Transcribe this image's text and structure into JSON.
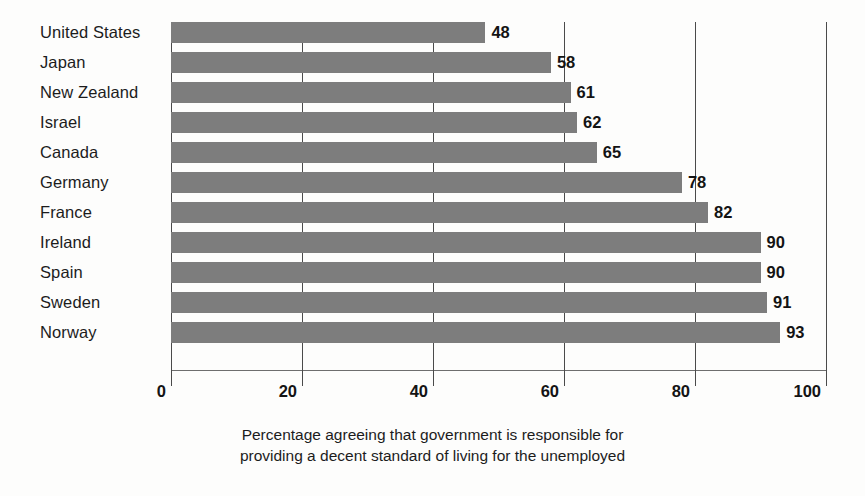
{
  "chart_data": {
    "type": "bar",
    "orientation": "horizontal",
    "title": "",
    "subtitle": "",
    "xlabel": "",
    "ylabel": "",
    "xlim": [
      0,
      100
    ],
    "ylim": null,
    "grid": true,
    "gridlines_axis": "x",
    "legend": false,
    "legend_position": "none",
    "xticks": [
      0,
      20,
      40,
      60,
      80,
      100
    ],
    "xticklabels": [
      "0",
      "20",
      "40",
      "60",
      "80",
      "100"
    ],
    "categories": [
      "United States",
      "Japan",
      "New Zealand",
      "Israel",
      "Canada",
      "Germany",
      "France",
      "Ireland",
      "Spain",
      "Sweden",
      "Norway"
    ],
    "values": [
      48,
      58,
      61,
      62,
      65,
      78,
      82,
      90,
      90,
      91,
      93
    ],
    "value_labels": [
      "48",
      "58",
      "61",
      "62",
      "65",
      "78",
      "82",
      "90",
      "90",
      "91",
      "93"
    ],
    "bar_color": "#7d7d7d",
    "background_color": "#fdfdfc",
    "text_color": "#1c1c1c",
    "axis_color": "#4a4a4a",
    "annotations": [
      "Percentage agreeing that government is responsible for",
      "providing a decent standard of living for the unemployed"
    ]
  },
  "caption": {
    "line1": "Percentage agreeing that government is responsible for",
    "line2": "providing a decent standard of living for the unemployed"
  }
}
